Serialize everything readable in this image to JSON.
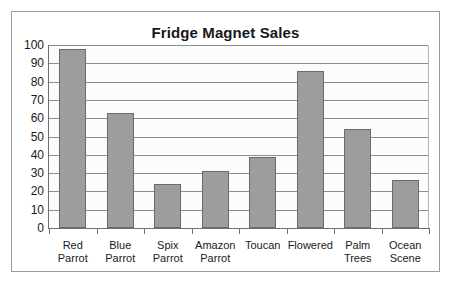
{
  "chart_data": {
    "type": "bar",
    "title": "Fridge Magnet Sales",
    "xlabel": "",
    "ylabel": "",
    "categories": [
      "Red Parrot",
      "Blue Parrot",
      "Spix Parrot",
      "Amazon Parrot",
      "Toucan",
      "Flowered",
      "Palm Trees",
      "Ocean Scene"
    ],
    "values": [
      98,
      63,
      24,
      31,
      39,
      86,
      54,
      26
    ],
    "ylim": [
      0,
      100
    ],
    "yticks": [
      0,
      10,
      20,
      30,
      40,
      50,
      60,
      70,
      80,
      90,
      100
    ],
    "ytick_labels": [
      "0",
      "10",
      "20",
      "30",
      "40",
      "50",
      "60",
      "70",
      "80",
      "90",
      "100"
    ],
    "grid": true,
    "legend": false,
    "bar_color": "#9d9d9d",
    "bar_border_color": "#6b6b6b",
    "plot_background": "#fcfcfc",
    "gridline_color": "#8d8d8d",
    "axis_color": "#6e6e6e",
    "frame_color": "#9b9b9b",
    "text_color": "#1a1a1a"
  },
  "category_label_lines": [
    [
      "Red Parrot"
    ],
    [
      "Blue",
      "Parrot"
    ],
    [
      "Spix",
      "Parrot"
    ],
    [
      "Amazon",
      "Parrot"
    ],
    [
      "Toucan"
    ],
    [
      "Flowered"
    ],
    [
      "Palm",
      "Trees"
    ],
    [
      "Ocean",
      "Scene"
    ]
  ]
}
